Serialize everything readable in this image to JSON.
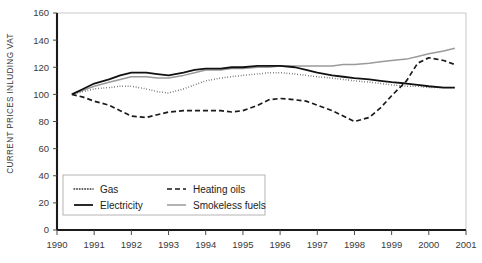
{
  "chart_data": {
    "type": "line",
    "title": "",
    "xlabel": "",
    "ylabel": "CURRENT PRICES INLUDING VAT",
    "xlim": [
      1990,
      2001
    ],
    "ylim": [
      0,
      160
    ],
    "ytick_step": 20,
    "grid": false,
    "legend_position": "inside-bottom-left",
    "xticks": [
      "1990",
      "1991",
      "1992",
      "1993",
      "1994",
      "1995",
      "1996",
      "1997",
      "1998",
      "1999",
      "2000",
      "2001"
    ],
    "yticks": [
      "0",
      "20",
      "40",
      "60",
      "80",
      "100",
      "120",
      "140",
      "160"
    ],
    "series": [
      {
        "name": "Gas",
        "style": "dotted",
        "color": "#333333",
        "x": [
          1990.4,
          1990.7,
          1991.0,
          1991.4,
          1991.7,
          1992.0,
          1992.4,
          1992.7,
          1993.0,
          1993.4,
          1993.7,
          1994.0,
          1994.4,
          1994.7,
          1995.0,
          1995.4,
          1995.7,
          1996.0,
          1996.4,
          1996.7,
          1997.0,
          1997.4,
          1997.7,
          1998.0,
          1998.4,
          1998.7,
          1999.0,
          1999.4,
          1999.7,
          2000.0,
          2000.4,
          2000.7
        ],
        "y": [
          100,
          102,
          104,
          105,
          106,
          106,
          104,
          102,
          101,
          104,
          107,
          110,
          112,
          113,
          114,
          115,
          116,
          116,
          115,
          114,
          113,
          112,
          111,
          110,
          109,
          108,
          107,
          106,
          106,
          105,
          105,
          105
        ]
      },
      {
        "name": "Heating oils",
        "style": "dashed",
        "color": "#1a1a1a",
        "x": [
          1990.4,
          1990.7,
          1991.0,
          1991.4,
          1991.7,
          1992.0,
          1992.4,
          1992.7,
          1993.0,
          1993.4,
          1993.7,
          1994.0,
          1994.4,
          1994.7,
          1995.0,
          1995.4,
          1995.7,
          1996.0,
          1996.4,
          1996.7,
          1997.0,
          1997.4,
          1997.7,
          1998.0,
          1998.4,
          1998.7,
          1999.0,
          1999.4,
          1999.7,
          2000.0,
          2000.4,
          2000.7
        ],
        "y": [
          100,
          98,
          95,
          92,
          88,
          84,
          83,
          85,
          87,
          88,
          88,
          88,
          88,
          87,
          88,
          92,
          96,
          97,
          96,
          95,
          92,
          88,
          84,
          80,
          83,
          90,
          99,
          110,
          123,
          127,
          125,
          122
        ]
      },
      {
        "name": "Electricity",
        "style": "solid",
        "color": "#111111",
        "x": [
          1990.4,
          1990.7,
          1991.0,
          1991.4,
          1991.7,
          1992.0,
          1992.4,
          1992.7,
          1993.0,
          1993.4,
          1993.7,
          1994.0,
          1994.4,
          1994.7,
          1995.0,
          1995.4,
          1995.7,
          1996.0,
          1996.4,
          1996.7,
          1997.0,
          1997.4,
          1997.7,
          1998.0,
          1998.4,
          1998.7,
          1999.0,
          1999.4,
          1999.7,
          2000.0,
          2000.4,
          2000.7
        ],
        "y": [
          100,
          104,
          108,
          111,
          114,
          116,
          116,
          115,
          114,
          116,
          118,
          119,
          119,
          120,
          120,
          121,
          121,
          121,
          120,
          118,
          116,
          114,
          113,
          112,
          111,
          110,
          109,
          108,
          107,
          106,
          105,
          105
        ]
      },
      {
        "name": "Smokeless fuels",
        "style": "solid-gray",
        "color": "#9a9a9a",
        "x": [
          1990.4,
          1990.7,
          1991.0,
          1991.4,
          1991.7,
          1992.0,
          1992.4,
          1992.7,
          1993.0,
          1993.4,
          1993.7,
          1994.0,
          1994.4,
          1994.7,
          1995.0,
          1995.4,
          1995.7,
          1996.0,
          1996.4,
          1996.7,
          1997.0,
          1997.4,
          1997.7,
          1998.0,
          1998.4,
          1998.7,
          1999.0,
          1999.4,
          1999.7,
          2000.0,
          2000.4,
          2000.7
        ],
        "y": [
          100,
          103,
          106,
          109,
          111,
          113,
          113,
          112,
          112,
          114,
          116,
          118,
          118,
          119,
          119,
          120,
          120,
          121,
          121,
          121,
          121,
          121,
          122,
          122,
          123,
          124,
          125,
          126,
          128,
          130,
          132,
          134
        ]
      }
    ],
    "legend_entries": [
      {
        "label": "Gas",
        "style": "dotted",
        "color": "#333333"
      },
      {
        "label": "Heating oils",
        "style": "dashed",
        "color": "#1a1a1a"
      },
      {
        "label": "Electricity",
        "style": "solid",
        "color": "#111111"
      },
      {
        "label": "Smokeless fuels",
        "style": "solid-gray",
        "color": "#9a9a9a"
      }
    ]
  }
}
